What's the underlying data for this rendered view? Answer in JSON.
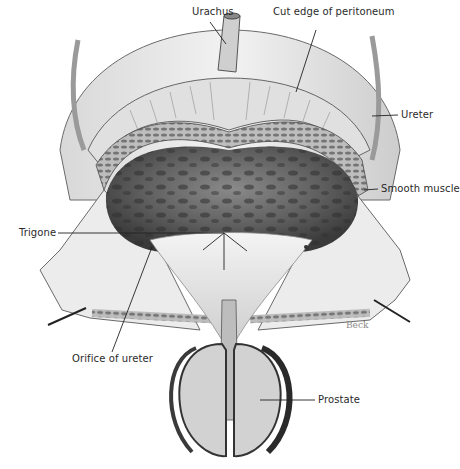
{
  "figure": {
    "palette": {
      "background": "#ffffff",
      "ink": "#2a2a2a",
      "mucosa_dark": "#4a4a4a",
      "mucosa_mid": "#7a7a7a",
      "tissue_light": "#e6e6e6",
      "tissue_mid": "#bdbdbd",
      "signature": "#8a8a8a"
    },
    "labels": [
      {
        "id": "urachus",
        "text": "Urachus",
        "x": 192,
        "y": 12,
        "pointer_to": [
          226,
          44
        ]
      },
      {
        "id": "cut-edge-peritoneum",
        "text": "Cut edge of peritoneum",
        "x": 273,
        "y": 12,
        "pointer_to": [
          296,
          92
        ]
      },
      {
        "id": "ureter",
        "text": "Ureter",
        "x": 401,
        "y": 109,
        "pointer_to": [
          372,
          116
        ]
      },
      {
        "id": "smooth-muscle",
        "text": "Smooth muscle",
        "x": 381,
        "y": 183,
        "pointer_to": [
          364,
          190
        ]
      },
      {
        "id": "trigone",
        "text": "Trigone",
        "x": 19,
        "y": 227,
        "pointer_to": [
          224,
          233
        ]
      },
      {
        "id": "orifice-ureter",
        "text": "Orifice of ureter",
        "x": 72,
        "y": 353,
        "pointer_to": [
          152,
          247
        ]
      },
      {
        "id": "prostate",
        "text": "Prostate",
        "x": 318,
        "y": 396,
        "pointer_to": [
          260,
          400
        ]
      }
    ],
    "signature": {
      "text": "Beck",
      "x": 346,
      "y": 322
    }
  }
}
